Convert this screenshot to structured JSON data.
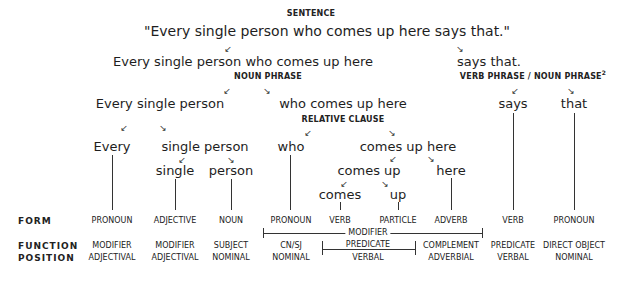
{
  "diagram": {
    "level0": {
      "label": "SENTENCE",
      "text": "\"Every single person who comes up here says that.\""
    },
    "level1": {
      "left": {
        "text": "Every single person who comes up here",
        "label": "NOUN PHRASE"
      },
      "right": {
        "text": "says that.",
        "label": "VERB PHRASE / NOUN PHRASE",
        "label_sup": "2"
      }
    },
    "level2": {
      "np_left": {
        "text": "Every single person"
      },
      "np_right": {
        "text": "who comes up here",
        "label": "RELATIVE CLAUSE"
      },
      "vp_left": {
        "text": "says"
      },
      "vp_right": {
        "text": "that"
      }
    },
    "level3": {
      "every": "Every",
      "single_person": "single person",
      "who": "who",
      "comes_up_here": "comes up here"
    },
    "level4": {
      "single": "single",
      "person": "person",
      "comes_up": "comes up",
      "here": "here"
    },
    "level5": {
      "comes": "comes",
      "up": "up"
    },
    "arrows": {
      "left": "↙",
      "right": "↘"
    },
    "table": {
      "row_labels": {
        "form": "FORM",
        "function": "FUNCTION",
        "position": "POSITION"
      },
      "columns": [
        {
          "word": "Every",
          "form": "PRONOUN",
          "function": "MODIFIER",
          "position": "ADJECTIVAL"
        },
        {
          "word": "single",
          "form": "ADJECTIVE",
          "function": "MODIFIER",
          "position": "ADJECTIVAL"
        },
        {
          "word": "person",
          "form": "NOUN",
          "function": "SUBJECT",
          "position": "NOMINAL"
        },
        {
          "word": "who",
          "form": "PRONOUN",
          "function": "CN/SJ",
          "position": "NOMINAL"
        },
        {
          "word": "comes",
          "form": "VERB",
          "function": "",
          "position": ""
        },
        {
          "word": "up",
          "form": "PARTICLE",
          "function": "",
          "position": ""
        },
        {
          "word": "here",
          "form": "ADVERB",
          "function": "COMPLEMENT",
          "position": "ADVERBIAL"
        },
        {
          "word": "says",
          "form": "VERB",
          "function": "PREDICATE",
          "position": "VERBAL"
        },
        {
          "word": "that",
          "form": "PRONOUN",
          "function": "DIRECT OBJECT",
          "position": "NOMINAL"
        }
      ],
      "modifier_bracket": {
        "label": "MODIFIER"
      },
      "predicate_bracket": {
        "function": "PREDICATE",
        "position": "VERBAL"
      }
    }
  }
}
